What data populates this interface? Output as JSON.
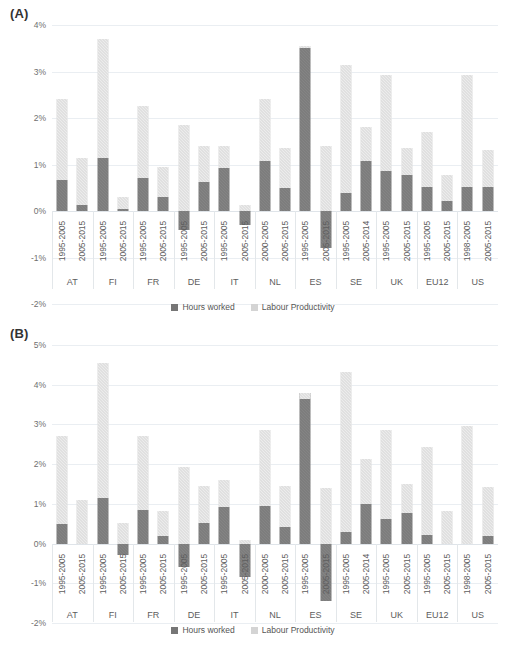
{
  "figure": {
    "panels": [
      {
        "label": "(A)"
      },
      {
        "label": "(B)"
      }
    ],
    "legend": {
      "hours_label": "Hours worked",
      "productivity_label": "Labour Productivity"
    },
    "colors": {
      "hours_worked": "#767676",
      "labour_productivity": "#d4d4d4",
      "gridline": "#eaeef2",
      "text": "#5d5d5d"
    }
  },
  "chart_data": [
    {
      "type": "bar",
      "title": "(A)",
      "stacked": true,
      "xlabel": "",
      "ylabel": "",
      "ylim": [
        -2,
        4
      ],
      "yticks": [
        "-2%",
        "-1%",
        "0%",
        "1%",
        "2%",
        "3%",
        "4%"
      ],
      "ytick_values": [
        -2,
        -1,
        0,
        1,
        2,
        3,
        4
      ],
      "grid": true,
      "legend": [
        "Hours worked",
        "Labour Productivity"
      ],
      "legend_position": "bottom",
      "groups": [
        {
          "country": "AT",
          "periods": [
            "1995-2005",
            "2005-2015"
          ]
        },
        {
          "country": "FI",
          "periods": [
            "1995-2005",
            "2005-2015"
          ]
        },
        {
          "country": "FR",
          "periods": [
            "1995-2005",
            "2005-2015"
          ]
        },
        {
          "country": "DE",
          "periods": [
            "1995-2005",
            "2005-2015"
          ]
        },
        {
          "country": "IT",
          "periods": [
            "1995-2005",
            "2005-2015"
          ]
        },
        {
          "country": "NL",
          "periods": [
            "2000-2005",
            "2005-2015"
          ]
        },
        {
          "country": "ES",
          "periods": [
            "1995-2005",
            "2005-2015"
          ]
        },
        {
          "country": "SE",
          "periods": [
            "1995-2005",
            "2005-2014"
          ]
        },
        {
          "country": "UK",
          "periods": [
            "1995-2005",
            "2005-2015"
          ]
        },
        {
          "country": "EU12",
          "periods": [
            "1995-2005",
            "2005-2015"
          ]
        },
        {
          "country": "US",
          "periods": [
            "1998-2005",
            "2005-2015"
          ]
        }
      ],
      "bars": [
        {
          "country": "AT",
          "period": "1995-2005",
          "hours_worked": 0.67,
          "labour_productivity": 1.73,
          "total": 2.4
        },
        {
          "country": "AT",
          "period": "2005-2015",
          "hours_worked": 0.12,
          "labour_productivity": 1.03,
          "total": 1.15
        },
        {
          "country": "FI",
          "period": "1995-2005",
          "hours_worked": 1.15,
          "labour_productivity": 2.55,
          "total": 3.7
        },
        {
          "country": "FI",
          "period": "2005-2015",
          "hours_worked": 0.05,
          "labour_productivity": 0.25,
          "total": 0.3
        },
        {
          "country": "FR",
          "period": "1995-2005",
          "hours_worked": 0.7,
          "labour_productivity": 1.55,
          "total": 2.25
        },
        {
          "country": "FR",
          "period": "2005-2015",
          "hours_worked": 0.3,
          "labour_productivity": 0.65,
          "total": 0.95
        },
        {
          "country": "DE",
          "period": "1995-2005",
          "hours_worked": -0.4,
          "labour_productivity": 1.85,
          "total": 1.45
        },
        {
          "country": "DE",
          "period": "2005-2015",
          "hours_worked": 0.62,
          "labour_productivity": 0.78,
          "total": 1.4
        },
        {
          "country": "IT",
          "period": "1995-2005",
          "hours_worked": 0.92,
          "labour_productivity": 0.48,
          "total": 1.4
        },
        {
          "country": "IT",
          "period": "2005-2015",
          "hours_worked": -0.3,
          "labour_productivity": 0.12,
          "total": -0.18
        },
        {
          "country": "NL",
          "period": "2000-2005",
          "hours_worked": 1.08,
          "labour_productivity": 1.32,
          "total": 2.4
        },
        {
          "country": "NL",
          "period": "2005-2015",
          "hours_worked": 0.5,
          "labour_productivity": 0.85,
          "total": 1.35
        },
        {
          "country": "ES",
          "period": "1995-2005",
          "hours_worked": 3.5,
          "labour_productivity": 0.05,
          "total": 3.55
        },
        {
          "country": "ES",
          "period": "2005-2015",
          "hours_worked": -0.8,
          "labour_productivity": 1.4,
          "total": 0.6
        },
        {
          "country": "SE",
          "period": "1995-2005",
          "hours_worked": 0.38,
          "labour_productivity": 2.75,
          "total": 3.13
        },
        {
          "country": "SE",
          "period": "2005-2014",
          "hours_worked": 1.08,
          "labour_productivity": 0.72,
          "total": 1.8
        },
        {
          "country": "UK",
          "period": "1995-2005",
          "hours_worked": 0.85,
          "labour_productivity": 2.08,
          "total": 2.93
        },
        {
          "country": "UK",
          "period": "2005-2015",
          "hours_worked": 0.78,
          "labour_productivity": 0.57,
          "total": 1.35
        },
        {
          "country": "EU12",
          "period": "1995-2005",
          "hours_worked": 0.52,
          "labour_productivity": 1.18,
          "total": 1.7
        },
        {
          "country": "EU12",
          "period": "2005-2015",
          "hours_worked": 0.22,
          "labour_productivity": 0.55,
          "total": 0.77
        },
        {
          "country": "US",
          "period": "1998-2005",
          "hours_worked": 0.52,
          "labour_productivity": 2.4,
          "total": 2.92
        },
        {
          "country": "US",
          "period": "2005-2015",
          "hours_worked": 0.52,
          "labour_productivity": 0.8,
          "total": 1.32
        }
      ]
    },
    {
      "type": "bar",
      "title": "(B)",
      "stacked": true,
      "xlabel": "",
      "ylabel": "",
      "ylim": [
        -2,
        5
      ],
      "yticks": [
        "-2%",
        "-1%",
        "0%",
        "1%",
        "2%",
        "3%",
        "4%",
        "5%"
      ],
      "ytick_values": [
        -2,
        -1,
        0,
        1,
        2,
        3,
        4,
        5
      ],
      "grid": true,
      "legend": [
        "Hours worked",
        "Labour Productivity"
      ],
      "legend_position": "bottom",
      "groups": [
        {
          "country": "AT",
          "periods": [
            "1995-2005",
            "2005-2015"
          ]
        },
        {
          "country": "FI",
          "periods": [
            "1995-2005",
            "2005-2015"
          ]
        },
        {
          "country": "FR",
          "periods": [
            "1995-2005",
            "2005-2015"
          ]
        },
        {
          "country": "DE",
          "periods": [
            "1995-2005",
            "2005-2015"
          ]
        },
        {
          "country": "IT",
          "periods": [
            "1995-2005",
            "2005-2015"
          ]
        },
        {
          "country": "NL",
          "periods": [
            "2000-2005",
            "2005-2015"
          ]
        },
        {
          "country": "ES",
          "periods": [
            "1995-2005",
            "2005-2015"
          ]
        },
        {
          "country": "SE",
          "periods": [
            "1995-2005",
            "2005-2014"
          ]
        },
        {
          "country": "UK",
          "periods": [
            "1995-2005",
            "2005-2015"
          ]
        },
        {
          "country": "EU12",
          "periods": [
            "1995-2005",
            "2005-2015"
          ]
        },
        {
          "country": "US",
          "periods": [
            "1998-2005",
            "2005-2015"
          ]
        }
      ],
      "bars": [
        {
          "country": "AT",
          "period": "1995-2005",
          "hours_worked": 0.5,
          "labour_productivity": 2.22,
          "total": 2.72
        },
        {
          "country": "AT",
          "period": "2005-2015",
          "hours_worked": 0.0,
          "labour_productivity": 1.1,
          "total": 1.1
        },
        {
          "country": "FI",
          "period": "1995-2005",
          "hours_worked": 1.15,
          "labour_productivity": 3.4,
          "total": 4.55
        },
        {
          "country": "FI",
          "period": "2005-2015",
          "hours_worked": -0.28,
          "labour_productivity": 0.53,
          "total": 0.25
        },
        {
          "country": "FR",
          "period": "1995-2005",
          "hours_worked": 0.85,
          "labour_productivity": 1.87,
          "total": 2.72
        },
        {
          "country": "FR",
          "period": "2005-2015",
          "hours_worked": 0.2,
          "labour_productivity": 0.62,
          "total": 0.82
        },
        {
          "country": "DE",
          "period": "1995-2005",
          "hours_worked": -0.6,
          "labour_productivity": 1.92,
          "total": 1.32
        },
        {
          "country": "DE",
          "period": "2005-2015",
          "hours_worked": 0.52,
          "labour_productivity": 0.93,
          "total": 1.45
        },
        {
          "country": "IT",
          "period": "1995-2005",
          "hours_worked": 0.92,
          "labour_productivity": 0.68,
          "total": 1.6
        },
        {
          "country": "IT",
          "period": "2005-2015",
          "hours_worked": -0.85,
          "labour_productivity": 0.08,
          "total": -0.77
        },
        {
          "country": "NL",
          "period": "2000-2005",
          "hours_worked": 0.95,
          "labour_productivity": 1.9,
          "total": 2.85
        },
        {
          "country": "NL",
          "period": "2005-2015",
          "hours_worked": 0.42,
          "labour_productivity": 1.03,
          "total": 1.45
        },
        {
          "country": "ES",
          "period": "1995-2005",
          "hours_worked": 3.8,
          "labour_productivity": -0.15,
          "total": 3.65
        },
        {
          "country": "ES",
          "period": "2005-2015",
          "hours_worked": -1.45,
          "labour_productivity": 1.4,
          "total": -0.05
        },
        {
          "country": "SE",
          "period": "1995-2005",
          "hours_worked": 0.3,
          "labour_productivity": 4.02,
          "total": 4.32
        },
        {
          "country": "SE",
          "period": "2005-2014",
          "hours_worked": 1.0,
          "labour_productivity": 1.12,
          "total": 2.12
        },
        {
          "country": "UK",
          "period": "1995-2005",
          "hours_worked": 0.62,
          "labour_productivity": 2.25,
          "total": 2.87
        },
        {
          "country": "UK",
          "period": "2005-2015",
          "hours_worked": 0.78,
          "labour_productivity": 0.72,
          "total": 1.5
        },
        {
          "country": "EU12",
          "period": "1995-2005",
          "hours_worked": 0.22,
          "labour_productivity": 2.22,
          "total": 2.44
        },
        {
          "country": "EU12",
          "period": "2005-2015",
          "hours_worked": 0.0,
          "labour_productivity": 0.82,
          "total": 0.82
        },
        {
          "country": "US",
          "period": "1998-2005",
          "hours_worked": 0.0,
          "labour_productivity": 2.95,
          "total": 2.95
        },
        {
          "country": "US",
          "period": "2005-2015",
          "hours_worked": 0.18,
          "labour_productivity": 1.25,
          "total": 1.43
        }
      ]
    }
  ]
}
